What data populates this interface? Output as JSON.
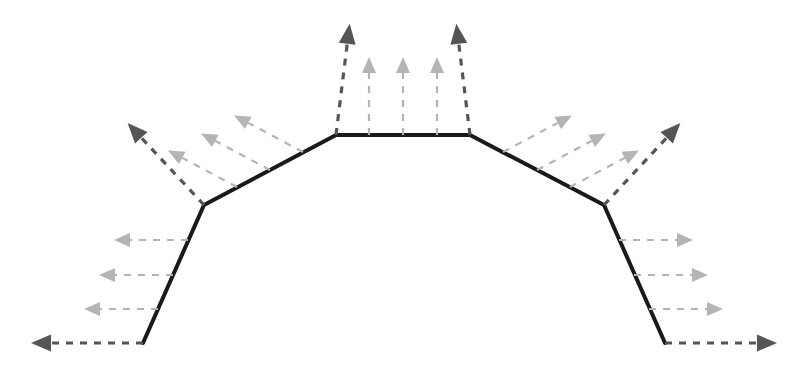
{
  "figure": {
    "width": 811,
    "height": 366,
    "background": "#ffffff"
  },
  "colors": {
    "polyline": "#1a1a1a",
    "vertex_arrow": "#555555",
    "segment_arrow": "#b4b4b4",
    "background": "#ffffff"
  },
  "chart_data": {
    "type": "line",
    "xlabel": "",
    "ylabel": "",
    "grid": false,
    "legend": false,
    "xlim": [
      0,
      811
    ],
    "ylim": [
      366,
      0
    ],
    "series": [
      {
        "name": "polyline",
        "stroke": "#1a1a1a",
        "stroke_width": 4,
        "dash": "none",
        "x": [
          143,
          204,
          336,
          470,
          604,
          665
        ],
        "y": [
          343,
          205,
          135,
          135,
          205,
          343
        ]
      }
    ],
    "annotations": {
      "vertex_normals": [
        {
          "name": "vertex-normal-0",
          "x": 143,
          "y": 343,
          "angle_deg": 180,
          "length": 112,
          "color": "#555555",
          "weight": "bold"
        },
        {
          "name": "vertex-normal-1",
          "x": 204,
          "y": 205,
          "angle_deg": 227,
          "length": 112,
          "color": "#555555",
          "weight": "bold"
        },
        {
          "name": "vertex-normal-2",
          "x": 336,
          "y": 135,
          "angle_deg": 277,
          "length": 112,
          "color": "#555555",
          "weight": "bold"
        },
        {
          "name": "vertex-normal-3",
          "x": 470,
          "y": 135,
          "angle_deg": 263,
          "length": 112,
          "color": "#555555",
          "weight": "bold"
        },
        {
          "name": "vertex-normal-4",
          "x": 604,
          "y": 205,
          "angle_deg": 313,
          "length": 112,
          "color": "#555555",
          "weight": "bold"
        },
        {
          "name": "vertex-normal-5",
          "x": 665,
          "y": 343,
          "angle_deg": 0,
          "length": 112,
          "color": "#555555",
          "weight": "bold"
        }
      ],
      "segment_normals": [
        {
          "name": "segment-normal-s0-a",
          "x": 158,
          "y": 309,
          "angle_deg": 180,
          "length": 74,
          "color": "#b4b4b4"
        },
        {
          "name": "segment-normal-s0-b",
          "x": 173,
          "y": 275,
          "angle_deg": 180,
          "length": 74,
          "color": "#b4b4b4"
        },
        {
          "name": "segment-normal-s0-c",
          "x": 188,
          "y": 240,
          "angle_deg": 180,
          "length": 74,
          "color": "#b4b4b4"
        },
        {
          "name": "segment-normal-s1-a",
          "x": 237,
          "y": 187,
          "angle_deg": 208,
          "length": 78,
          "color": "#b4b4b4"
        },
        {
          "name": "segment-normal-s1-b",
          "x": 270,
          "y": 170,
          "angle_deg": 208,
          "length": 78,
          "color": "#b4b4b4"
        },
        {
          "name": "segment-normal-s1-c",
          "x": 303,
          "y": 152,
          "angle_deg": 208,
          "length": 78,
          "color": "#b4b4b4"
        },
        {
          "name": "segment-normal-s2-a",
          "x": 369,
          "y": 135,
          "angle_deg": 270,
          "length": 78,
          "color": "#b4b4b4"
        },
        {
          "name": "segment-normal-s2-b",
          "x": 403,
          "y": 135,
          "angle_deg": 270,
          "length": 78,
          "color": "#b4b4b4"
        },
        {
          "name": "segment-normal-s2-c",
          "x": 437,
          "y": 135,
          "angle_deg": 270,
          "length": 78,
          "color": "#b4b4b4"
        },
        {
          "name": "segment-normal-s3-a",
          "x": 503,
          "y": 152,
          "angle_deg": 332,
          "length": 78,
          "color": "#b4b4b4"
        },
        {
          "name": "segment-normal-s3-b",
          "x": 537,
          "y": 170,
          "angle_deg": 332,
          "length": 78,
          "color": "#b4b4b4"
        },
        {
          "name": "segment-normal-s3-c",
          "x": 570,
          "y": 187,
          "angle_deg": 332,
          "length": 78,
          "color": "#b4b4b4"
        },
        {
          "name": "segment-normal-s4-a",
          "x": 619,
          "y": 240,
          "angle_deg": 0,
          "length": 74,
          "color": "#b4b4b4"
        },
        {
          "name": "segment-normal-s4-b",
          "x": 634,
          "y": 275,
          "angle_deg": 0,
          "length": 74,
          "color": "#b4b4b4"
        },
        {
          "name": "segment-normal-s4-c",
          "x": 649,
          "y": 309,
          "angle_deg": 0,
          "length": 74,
          "color": "#b4b4b4"
        }
      ]
    },
    "style": {
      "arrow_dash_pattern": "7 7",
      "vertex_arrow_stroke_width": 3.2,
      "segment_arrow_stroke_width": 2.2,
      "vertex_arrow_head_length": 20,
      "vertex_arrow_head_width": 17,
      "segment_arrow_head_length": 16,
      "segment_arrow_head_width": 14
    }
  }
}
